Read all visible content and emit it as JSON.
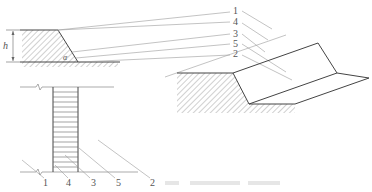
{
  "figure": {
    "type": "engineering-diagram",
    "views": [
      "cross-section",
      "isometric",
      "plan"
    ],
    "colors": {
      "stroke": "#444444",
      "leader": "#9a9a9a",
      "hatch": "#8a8a8a",
      "label": "#555555"
    }
  },
  "section_view": {
    "dimension_label": "h",
    "angle_label": "α"
  },
  "iso_view": {
    "callouts": [
      {
        "id": "1",
        "label": "1"
      },
      {
        "id": "4",
        "label": "4"
      },
      {
        "id": "3",
        "label": "3"
      },
      {
        "id": "5",
        "label": "5"
      },
      {
        "id": "2",
        "label": "2"
      }
    ]
  },
  "plan_view": {
    "callouts": [
      {
        "id": "1",
        "label": "1"
      },
      {
        "id": "4",
        "label": "4"
      },
      {
        "id": "3",
        "label": "3"
      },
      {
        "id": "5",
        "label": "5"
      },
      {
        "id": "2",
        "label": "2"
      }
    ]
  }
}
